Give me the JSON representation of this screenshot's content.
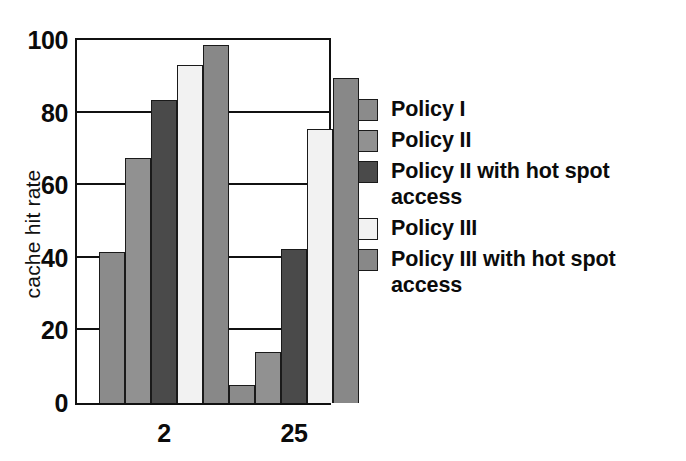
{
  "chart_data": {
    "type": "bar",
    "title": "",
    "subtitle": "",
    "xlabel": "",
    "ylabel": "cache hit rate",
    "categories": [
      "2",
      "25"
    ],
    "ylim": [
      0,
      100
    ],
    "yticks": [
      0,
      20,
      40,
      60,
      80,
      100
    ],
    "ytick_labels": [
      "0",
      "20",
      "40",
      "60",
      "80",
      "100"
    ],
    "grid": true,
    "grid_axis": "y",
    "legend_position": "right",
    "series": [
      {
        "name": "Policy I",
        "color": "#8b8b8b",
        "values": [
          41.5,
          5.0
        ]
      },
      {
        "name": "Policy II",
        "color": "#919191",
        "values": [
          67.5,
          14.0
        ]
      },
      {
        "name": "Policy II  with hot spot access",
        "color": "#4a4a4a",
        "values": [
          83.5,
          42.5
        ]
      },
      {
        "name": "Policy III",
        "color": "#f2f2f2",
        "values": [
          93.0,
          75.5
        ]
      },
      {
        "name": "Policy III  with hot spot access",
        "color": "#888888",
        "values": [
          98.5,
          89.5
        ]
      }
    ]
  },
  "legend": {
    "items": [
      {
        "label": "Policy I",
        "color": "#8b8b8b"
      },
      {
        "label": "Policy II",
        "color": "#919191"
      },
      {
        "label": "Policy II  with hot spot\naccess",
        "color": "#4a4a4a"
      },
      {
        "label": "Policy III",
        "color": "#f2f2f2"
      },
      {
        "label": "Policy III  with hot spot\naccess",
        "color": "#888888"
      }
    ]
  },
  "axes": {
    "y_axis_title": "cache hit rate",
    "x_tick_labels": [
      "2",
      "25"
    ],
    "y_tick_labels": [
      "100",
      "80",
      "60",
      "40",
      "20",
      "0"
    ]
  }
}
